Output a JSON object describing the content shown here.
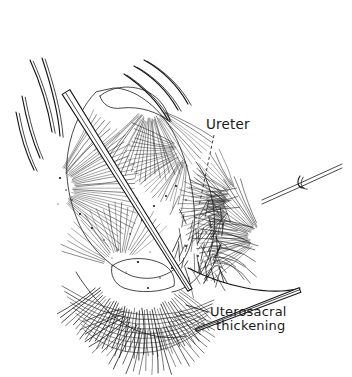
{
  "figure": {
    "kind": "pen-and-ink surgical illustration",
    "background_color": "#ffffff",
    "ink_color": "#1a1a1a",
    "width": 352,
    "height": 377
  },
  "labels": [
    {
      "id": "ureter",
      "text": "Ureter",
      "x": 206,
      "y": 129,
      "leader": {
        "style": "dashed",
        "from_x": 214,
        "from_y": 135,
        "to_x": 199,
        "to_y": 206
      }
    },
    {
      "id": "uterosacral-thickening-line1",
      "text": "Uterosacral",
      "x": 210,
      "y": 316,
      "leader": {
        "style": "solid",
        "from_x": 208,
        "from_y": 312,
        "to_x": 186,
        "to_y": 305
      }
    },
    {
      "id": "uterosacral-thickening-line2",
      "text": "thickening",
      "x": 216,
      "y": 330,
      "leader": null
    }
  ],
  "anatomy": {
    "uterus": {
      "name": "uterus-body",
      "outline": "M 96 92 C 84 104 72 126 68 152 C 64 178 70 206 82 230 C 94 252 112 268 132 276 C 152 282 170 276 182 262 C 192 248 196 228 194 206 C 192 180 184 152 172 130 C 158 106 134 88 114 88 Z",
      "hatch_fans": [
        {
          "cx": 52,
          "cy": 188,
          "r0": 22,
          "r1": 86,
          "a0": -62,
          "a1": 46,
          "count": 34
        },
        {
          "cx": 150,
          "cy": 104,
          "r0": 16,
          "r1": 74,
          "a0": 28,
          "a1": 140,
          "count": 30
        },
        {
          "cx": 188,
          "cy": 150,
          "r0": 14,
          "r1": 58,
          "a0": 96,
          "a1": 206,
          "count": 26
        },
        {
          "cx": 120,
          "cy": 268,
          "r0": 18,
          "r1": 62,
          "a0": 196,
          "a1": 318,
          "count": 22
        }
      ]
    },
    "fundus_dome": {
      "name": "uterine-fundus",
      "outline": "M 100 96 C 112 86 132 84 148 92 C 160 98 168 110 170 122 C 158 112 140 106 122 108 C 110 110 102 104 100 96 Z"
    },
    "right_pelvic_wall": {
      "name": "right-pelvic-sidewall",
      "outline": "M 196 162 C 206 174 212 192 214 212 C 216 232 212 252 204 268 C 196 282 184 290 172 292",
      "hatch_fans": [
        {
          "cx": 232,
          "cy": 206,
          "r0": 10,
          "r1": 52,
          "a0": 118,
          "a1": 232,
          "count": 24
        }
      ]
    },
    "broad_ligament": {
      "name": "broad-ligament-fan",
      "hatch_fans": [
        {
          "cx": 262,
          "cy": 238,
          "r0": 14,
          "r1": 66,
          "a0": 140,
          "a1": 250,
          "count": 26
        },
        {
          "cx": 238,
          "cy": 196,
          "r0": 12,
          "r1": 46,
          "a0": 150,
          "a1": 248,
          "count": 18
        }
      ]
    },
    "uterosacral_ligament": {
      "name": "uterosacral-ligament",
      "outline": "M 188 268 C 204 276 224 284 246 288 C 266 292 286 292 300 288",
      "hatch_dark": true
    },
    "deep_pelvis": {
      "name": "deep-pelvic-floor",
      "outline": "M 76 272 C 88 292 104 310 124 324 C 144 336 166 340 186 336",
      "hatch_fans": [
        {
          "cx": 140,
          "cy": 258,
          "r0": 52,
          "r1": 98,
          "a0": 38,
          "a1": 146,
          "count": 40
        },
        {
          "cx": 150,
          "cy": 300,
          "r0": 30,
          "r1": 74,
          "a0": 20,
          "a1": 162,
          "count": 30
        }
      ]
    },
    "cervix_vault": {
      "name": "cervix-vaginal-vault",
      "outline": "M 112 266 C 122 258 142 256 158 262 C 170 266 176 276 174 286 C 162 292 140 294 124 288 C 114 284 110 274 112 266 Z"
    }
  },
  "instruments": [
    {
      "name": "long-dissecting-forceps",
      "type": "forceps-shaft",
      "x1": 66,
      "y1": 92,
      "x2": 190,
      "y2": 290,
      "width": 9
    },
    {
      "name": "retractor-prong-upper-left-1",
      "type": "curved-prong",
      "path": "M 30 60 C 40 82 48 108 52 132"
    },
    {
      "name": "retractor-prong-upper-left-2",
      "type": "curved-prong",
      "path": "M 42 58 C 50 82 58 110 60 136"
    },
    {
      "name": "retractor-prong-upper-left-3",
      "type": "curved-prong",
      "path": "M 22 96 C 26 118 32 140 40 158"
    },
    {
      "name": "retractor-prong-upper-left-4",
      "type": "curved-prong",
      "path": "M 16 112 C 20 134 26 154 34 170"
    },
    {
      "name": "retractor-prong-top-center-1",
      "type": "curved-prong",
      "path": "M 134 66 C 152 76 168 92 178 110"
    },
    {
      "name": "retractor-prong-top-center-2",
      "type": "curved-prong",
      "path": "M 144 60 C 162 70 178 86 188 104"
    },
    {
      "name": "retractor-prong-top-center-3",
      "type": "curved-prong",
      "path": "M 124 74 C 142 86 158 102 168 120"
    },
    {
      "name": "needle-holder-right",
      "type": "needle",
      "path": "M 342 164 L 298 184 L 262 200"
    },
    {
      "name": "suture-hook-right",
      "type": "hook",
      "path": "M 300 176 C 296 182 298 188 304 188"
    },
    {
      "name": "tissue-forceps-lower-right",
      "type": "forceps-shaft",
      "x1": 300,
      "y1": 290,
      "x2": 196,
      "y2": 330,
      "width": 5
    }
  ],
  "stipple_points": [
    [
      60,
      178
    ],
    [
      66,
      190
    ],
    [
      72,
      200
    ],
    [
      58,
      204
    ],
    [
      80,
      214
    ],
    [
      92,
      228
    ],
    [
      104,
      240
    ],
    [
      118,
      250
    ],
    [
      130,
      234
    ],
    [
      142,
      220
    ],
    [
      154,
      206
    ],
    [
      166,
      196
    ],
    [
      176,
      186
    ],
    [
      186,
      200
    ],
    [
      196,
      218
    ],
    [
      206,
      232
    ],
    [
      150,
      252
    ],
    [
      138,
      262
    ],
    [
      126,
      272
    ],
    [
      112,
      258
    ],
    [
      186,
      246
    ],
    [
      198,
      256
    ],
    [
      172,
      268
    ],
    [
      160,
      278
    ],
    [
      148,
      288
    ]
  ]
}
